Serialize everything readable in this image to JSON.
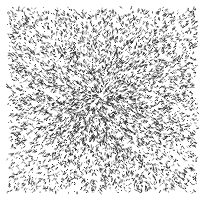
{
  "figure": {
    "title": "",
    "subtitle": "",
    "width": 206,
    "height": 200,
    "background_color": "#ffffff",
    "has_text": false,
    "has_axes": false,
    "has_legend": false,
    "has_border": false,
    "description": "Abstract monochrome stipple field of short dark dashes forming a radial starburst converging on a central focus, overlaid with diagonal cross-hatch alignment."
  },
  "chart_data": {
    "type": "scatter",
    "title": "",
    "subtitle": "",
    "xlabel": "",
    "ylabel": "",
    "xlim": [
      7,
      198
    ],
    "ylim": [
      7,
      193
    ],
    "grid": false,
    "legend_position": "none",
    "tick_labels_x": [],
    "tick_labels_y": [],
    "annotations": [],
    "marker": {
      "style": "dash",
      "color": "#1c1c1c",
      "length_px_min": 1,
      "length_px_max": 3.4,
      "width_px": 1,
      "opacity_min": 0.35,
      "opacity_max": 1.0
    },
    "field": {
      "plot_left": 7,
      "plot_top": 7,
      "plot_right": 198,
      "plot_bottom": 193,
      "mark_count": 6400,
      "random_seed": 20240517,
      "focus_x": 100,
      "focus_y": 98,
      "radial_alignment_strength": 0.72,
      "diagonal_alignment_strength": 0.3,
      "diagonal_angles_deg": [
        45,
        135
      ],
      "center_density_boost": 2.35,
      "density_falloff_radius": 46,
      "edge_fade_px": 5
    }
  },
  "colors": {
    "ink": "#1c1c1c",
    "paper": "#ffffff"
  }
}
